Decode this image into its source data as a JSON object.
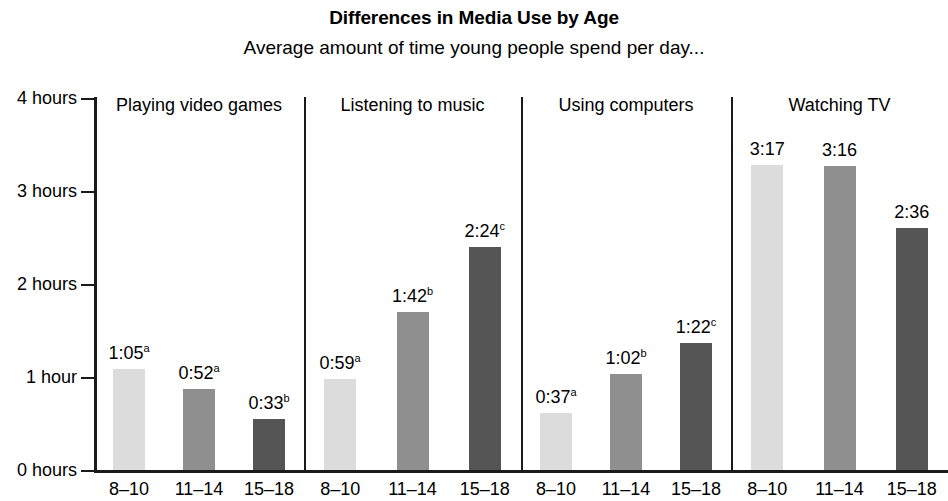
{
  "chart_data": {
    "type": "bar",
    "title": "Differences in Media Use by Age",
    "subtitle": "Average amount of time young people spend per day...",
    "xlabel": "",
    "ylabel": "",
    "ylim": [
      0,
      4
    ],
    "grid": false,
    "legend": "none",
    "y_ticks": [
      {
        "value": 0,
        "label": "0 hours"
      },
      {
        "value": 1,
        "label": "1 hour"
      },
      {
        "value": 2,
        "label": "2 hours"
      },
      {
        "value": 3,
        "label": "3 hours"
      },
      {
        "value": 4,
        "label": "4 hours"
      }
    ],
    "categories": [
      "8–10",
      "11–14",
      "15–18"
    ],
    "panels": [
      {
        "name": "Playing video games",
        "bars": [
          {
            "category": "8–10",
            "label": "1:05",
            "superscript": "a",
            "hours": 1.0833,
            "shade": "light"
          },
          {
            "category": "11–14",
            "label": "0:52",
            "superscript": "a",
            "hours": 0.8667,
            "shade": "medium"
          },
          {
            "category": "15–18",
            "label": "0:33",
            "superscript": "b",
            "hours": 0.55,
            "shade": "dark"
          }
        ]
      },
      {
        "name": "Listening to music",
        "bars": [
          {
            "category": "8–10",
            "label": "0:59",
            "superscript": "a",
            "hours": 0.9833,
            "shade": "light"
          },
          {
            "category": "11–14",
            "label": "1:42",
            "superscript": "b",
            "hours": 1.7,
            "shade": "medium"
          },
          {
            "category": "15–18",
            "label": "2:24",
            "superscript": "c",
            "hours": 2.4,
            "shade": "dark"
          }
        ]
      },
      {
        "name": "Using computers",
        "bars": [
          {
            "category": "8–10",
            "label": "0:37",
            "superscript": "a",
            "hours": 0.6167,
            "shade": "light"
          },
          {
            "category": "11–14",
            "label": "1:02",
            "superscript": "b",
            "hours": 1.0333,
            "shade": "medium"
          },
          {
            "category": "15–18",
            "label": "1:22",
            "superscript": "c",
            "hours": 1.3667,
            "shade": "dark"
          }
        ]
      },
      {
        "name": "Watching TV",
        "bars": [
          {
            "category": "8–10",
            "label": "3:17",
            "superscript": "",
            "hours": 3.2833,
            "shade": "light"
          },
          {
            "category": "11–14",
            "label": "3:16",
            "superscript": "",
            "hours": 3.2667,
            "shade": "medium"
          },
          {
            "category": "15–18",
            "label": "2:36",
            "superscript": "",
            "hours": 2.6,
            "shade": "dark"
          }
        ]
      }
    ],
    "colors": {
      "light": "#dcdcdc",
      "medium": "#8f8f8f",
      "dark": "#555555",
      "axis": "#1a1a1a",
      "text": "#000000",
      "background": "#ffffff"
    }
  }
}
